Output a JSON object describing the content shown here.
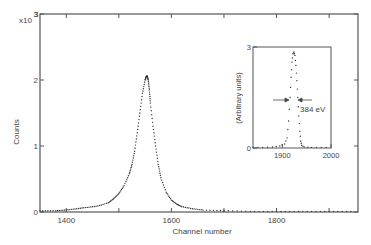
{
  "chart_data": [
    {
      "type": "scatter",
      "title": "",
      "xlabel": "Channel number",
      "ylabel": "Counts",
      "y_multiplier": "x10",
      "y_multiplier_exp": "3",
      "xlim": [
        1350,
        1955
      ],
      "ylim": [
        0,
        3
      ],
      "xticks": [
        1400,
        1500,
        1600,
        1700,
        1800,
        1900
      ],
      "xtick_labels": [
        "1400",
        "",
        "1600",
        "",
        "1800",
        ""
      ],
      "yticks": [
        0,
        1,
        2,
        3
      ],
      "ytick_labels": [
        "0",
        "1",
        "2",
        "3"
      ],
      "grid": false,
      "series": [
        {
          "name": "spectrum",
          "x": [
            1350,
            1380,
            1400,
            1420,
            1440,
            1460,
            1480,
            1490,
            1500,
            1510,
            1520,
            1525,
            1530,
            1535,
            1540,
            1545,
            1550,
            1552,
            1554,
            1556,
            1558,
            1560,
            1565,
            1570,
            1575,
            1580,
            1590,
            1600,
            1610,
            1620,
            1640,
            1660,
            1700,
            1750,
            1800,
            1850,
            1900,
            1950
          ],
          "values": [
            0.02,
            0.02,
            0.03,
            0.05,
            0.07,
            0.09,
            0.14,
            0.2,
            0.28,
            0.4,
            0.58,
            0.72,
            0.92,
            1.2,
            1.5,
            1.8,
            2.0,
            2.05,
            2.06,
            2.0,
            1.85,
            1.65,
            1.3,
            1.0,
            0.72,
            0.52,
            0.3,
            0.18,
            0.12,
            0.08,
            0.05,
            0.03,
            0.02,
            0.01,
            0.01,
            0.01,
            0.01,
            0.01
          ]
        }
      ],
      "peak": {
        "channel": 1554,
        "counts": 2.05
      }
    },
    {
      "type": "scatter",
      "title": "inset",
      "xlabel": "",
      "ylabel": "(Arbitrary units)",
      "xlim": [
        1840,
        2000
      ],
      "ylim": [
        0,
        3
      ],
      "xticks": [
        1900,
        2000
      ],
      "xtick_labels": [
        "1900",
        "2000"
      ],
      "yticks": [
        0,
        3
      ],
      "ytick_labels": [
        "0",
        "3"
      ],
      "annotations": [
        {
          "text": "384 eV",
          "type": "FWHM arrows",
          "y": 1.45
        }
      ],
      "series": [
        {
          "name": "inset spectrum",
          "x": [
            1840,
            1860,
            1880,
            1895,
            1905,
            1910,
            1913,
            1916,
            1918,
            1920,
            1922,
            1924,
            1926,
            1928,
            1930,
            1932,
            1934,
            1936,
            1938,
            1940,
            1945,
            1960,
            1980,
            2000
          ],
          "values": [
            0.02,
            0.02,
            0.03,
            0.06,
            0.12,
            0.3,
            0.8,
            1.5,
            2.1,
            2.55,
            2.8,
            2.85,
            2.75,
            2.45,
            2.0,
            1.5,
            0.95,
            0.5,
            0.2,
            0.08,
            0.03,
            0.02,
            0.02,
            0.02
          ]
        }
      ]
    }
  ],
  "labels": {
    "y_multiplier": "x10",
    "y_exp": "3",
    "ylabel": "Counts",
    "xlabel": "Channel number",
    "inset_ylabel": "(Arbitrary units)",
    "fwhm": "384 eV"
  }
}
